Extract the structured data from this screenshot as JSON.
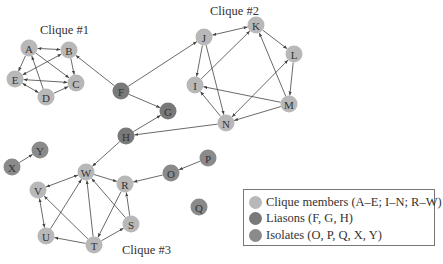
{
  "colors": {
    "clique": "#b8b8b8",
    "liaison": "#797979",
    "isolate": "#8a8a8a",
    "edge": "#444444"
  },
  "captions": [
    {
      "text": "Clique #1",
      "x": 40,
      "y": 34
    },
    {
      "text": "Clique #2",
      "x": 210,
      "y": 15
    },
    {
      "text": "Clique #3",
      "x": 122,
      "y": 254
    }
  ],
  "nodes": [
    {
      "id": "A",
      "x": 29,
      "y": 48,
      "type": "clique"
    },
    {
      "id": "B",
      "x": 69,
      "y": 50,
      "type": "clique"
    },
    {
      "id": "C",
      "x": 76,
      "y": 83,
      "type": "clique"
    },
    {
      "id": "D",
      "x": 46,
      "y": 97,
      "type": "clique"
    },
    {
      "id": "E",
      "x": 15,
      "y": 79,
      "type": "clique"
    },
    {
      "id": "F",
      "x": 121,
      "y": 91,
      "type": "liaison"
    },
    {
      "id": "G",
      "x": 168,
      "y": 111,
      "type": "liaison"
    },
    {
      "id": "H",
      "x": 126,
      "y": 136,
      "type": "liaison"
    },
    {
      "id": "I",
      "x": 195,
      "y": 85,
      "type": "clique"
    },
    {
      "id": "J",
      "x": 204,
      "y": 37,
      "type": "clique"
    },
    {
      "id": "K",
      "x": 256,
      "y": 25,
      "type": "clique"
    },
    {
      "id": "L",
      "x": 294,
      "y": 54,
      "type": "clique"
    },
    {
      "id": "M",
      "x": 289,
      "y": 104,
      "type": "clique"
    },
    {
      "id": "N",
      "x": 226,
      "y": 123,
      "type": "clique"
    },
    {
      "id": "O",
      "x": 171,
      "y": 173,
      "type": "isolate"
    },
    {
      "id": "P",
      "x": 208,
      "y": 158,
      "type": "isolate"
    },
    {
      "id": "Q",
      "x": 199,
      "y": 207,
      "type": "isolate"
    },
    {
      "id": "R",
      "x": 125,
      "y": 184,
      "type": "clique"
    },
    {
      "id": "S",
      "x": 131,
      "y": 224,
      "type": "clique"
    },
    {
      "id": "T",
      "x": 94,
      "y": 245,
      "type": "clique"
    },
    {
      "id": "U",
      "x": 46,
      "y": 236,
      "type": "clique"
    },
    {
      "id": "V",
      "x": 38,
      "y": 190,
      "type": "clique"
    },
    {
      "id": "W",
      "x": 86,
      "y": 172,
      "type": "clique"
    },
    {
      "id": "X",
      "x": 12,
      "y": 167,
      "type": "isolate"
    },
    {
      "id": "Y",
      "x": 40,
      "y": 150,
      "type": "isolate"
    }
  ],
  "edges": [
    {
      "from": "A",
      "to": "B",
      "bi": true
    },
    {
      "from": "A",
      "to": "E",
      "bi": false
    },
    {
      "from": "A",
      "to": "C",
      "bi": false
    },
    {
      "from": "D",
      "to": "A",
      "bi": false
    },
    {
      "from": "E",
      "to": "B",
      "bi": true
    },
    {
      "from": "B",
      "to": "C",
      "bi": false
    },
    {
      "from": "C",
      "to": "E",
      "bi": true
    },
    {
      "from": "D",
      "to": "E",
      "bi": true
    },
    {
      "from": "D",
      "to": "C",
      "bi": false
    },
    {
      "from": "F",
      "to": "B",
      "bi": false
    },
    {
      "from": "F",
      "to": "J",
      "bi": false
    },
    {
      "from": "F",
      "to": "G",
      "bi": false
    },
    {
      "from": "H",
      "to": "G",
      "bi": false
    },
    {
      "from": "N",
      "to": "H",
      "bi": false
    },
    {
      "from": "H",
      "to": "W",
      "bi": false
    },
    {
      "from": "K",
      "to": "J",
      "bi": true
    },
    {
      "from": "J",
      "to": "I",
      "bi": false
    },
    {
      "from": "J",
      "to": "N",
      "bi": false
    },
    {
      "from": "I",
      "to": "K",
      "bi": false
    },
    {
      "from": "K",
      "to": "L",
      "bi": false
    },
    {
      "from": "M",
      "to": "K",
      "bi": false
    },
    {
      "from": "L",
      "to": "M",
      "bi": false
    },
    {
      "from": "N",
      "to": "L",
      "bi": true
    },
    {
      "from": "M",
      "to": "I",
      "bi": false
    },
    {
      "from": "M",
      "to": "N",
      "bi": false
    },
    {
      "from": "N",
      "to": "I",
      "bi": false
    },
    {
      "from": "P",
      "to": "O",
      "bi": false
    },
    {
      "from": "O",
      "to": "R",
      "bi": false
    },
    {
      "from": "X",
      "to": "Y",
      "bi": false
    },
    {
      "from": "W",
      "to": "V",
      "bi": true
    },
    {
      "from": "W",
      "to": "R",
      "bi": false
    },
    {
      "from": "V",
      "to": "U",
      "bi": true
    },
    {
      "from": "U",
      "to": "W",
      "bi": false
    },
    {
      "from": "T",
      "to": "W",
      "bi": false
    },
    {
      "from": "T",
      "to": "V",
      "bi": false
    },
    {
      "from": "T",
      "to": "U",
      "bi": false
    },
    {
      "from": "T",
      "to": "S",
      "bi": false
    },
    {
      "from": "R",
      "to": "T",
      "bi": false
    },
    {
      "from": "S",
      "to": "R",
      "bi": false
    },
    {
      "from": "S",
      "to": "W",
      "bi": false
    }
  ],
  "legend": {
    "items": [
      {
        "type": "clique",
        "label": "Clique members (A–E; I–N; R–W)"
      },
      {
        "type": "liaison",
        "label": "Liasons (F, G, H)"
      },
      {
        "type": "isolate",
        "label": "Isolates (O, P, Q, X, Y)"
      }
    ]
  }
}
